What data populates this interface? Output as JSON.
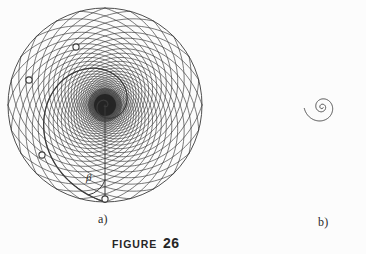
{
  "figure": {
    "label_word": "FIGURE",
    "label_number": "26",
    "background_color": "#fcfcfc",
    "ink_color": "#3a3a3a"
  },
  "panels": [
    {
      "id": "a",
      "caption": "a)",
      "type": "orthogonal-logarithmic-spiral-net",
      "center": [
        105,
        105
      ],
      "radius": 97,
      "arm_count": 24,
      "pitch_angle_deg": 72,
      "annotation": {
        "angle_symbol": "β",
        "marked_points": [
          [
            105,
            199
          ],
          [
            42,
            155
          ],
          [
            29,
            80
          ],
          [
            76,
            47
          ]
        ]
      }
    },
    {
      "id": "b",
      "caption": "b)",
      "type": "logarithmic-spiral",
      "pole": [
        322,
        107
      ],
      "growth_factor": 0.171,
      "turns": 2.4,
      "tail_point": [
        320,
        207
      ]
    }
  ],
  "chart_data": {
    "type": "line",
    "xlabel": "",
    "ylabel": "",
    "subplots": [
      {
        "name": "a)",
        "description": "Disc of radius 97 px filled with two mutually orthogonal families of equiangular (logarithmic) spirals meeting the radius at the constant angle beta.",
        "series": [
          {
            "name": "spiral-family-clockwise",
            "count": 24,
            "pitch_angle_deg": 72
          },
          {
            "name": "spiral-family-counterclockwise",
            "count": 24,
            "pitch_angle_deg": -72
          }
        ],
        "annotations": [
          "β"
        ],
        "marker_count": 4
      },
      {
        "name": "b)",
        "description": "Single logarithmic spiral r = a*exp(b*theta) unwinding from the pole outward through about 2.4 turns.",
        "series": [
          {
            "name": "logarithmic-spiral",
            "growth_b": 0.171,
            "turns": 2.4
          }
        ],
        "annotations": [],
        "marker_count": 0
      }
    ],
    "grid": false,
    "legend": "none"
  }
}
